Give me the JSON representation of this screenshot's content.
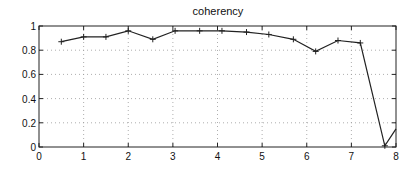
{
  "chart_data": {
    "type": "line",
    "title": "coherency",
    "xlabel": "",
    "ylabel": "",
    "xlim": [
      0,
      8
    ],
    "ylim": [
      0,
      1
    ],
    "xticks": [
      0,
      1,
      2,
      3,
      4,
      5,
      6,
      7,
      8
    ],
    "yticks": [
      0,
      0.2,
      0.4,
      0.6,
      0.8,
      1
    ],
    "xtick_labels": [
      "0",
      "1",
      "2",
      "3",
      "4",
      "5",
      "6",
      "7",
      "8"
    ],
    "ytick_labels": [
      "0",
      "0.2",
      "0.4",
      "0.6",
      "0.8",
      "1"
    ],
    "grid": true,
    "grid_style": "dotted",
    "legend": null,
    "marker": "+",
    "series": [
      {
        "name": "coherency",
        "color": "#222222",
        "x": [
          0.5,
          1.0,
          1.5,
          2.0,
          2.55,
          3.05,
          3.6,
          4.1,
          4.65,
          5.15,
          5.7,
          6.2,
          6.7,
          7.2,
          7.75,
          8.0
        ],
        "y": [
          0.87,
          0.91,
          0.91,
          0.96,
          0.89,
          0.96,
          0.96,
          0.96,
          0.95,
          0.93,
          0.89,
          0.79,
          0.88,
          0.86,
          0.01,
          0.15
        ]
      }
    ]
  },
  "layout": {
    "plot_left": 39,
    "plot_top": 26,
    "plot_right": 396,
    "plot_bottom": 147
  }
}
